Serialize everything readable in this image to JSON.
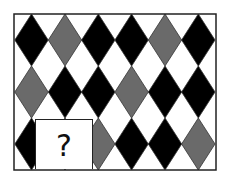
{
  "puzzle": {
    "frame": {
      "x": 14,
      "y": 14,
      "width": 202,
      "height": 156,
      "stroke": "#222222"
    },
    "diamond": {
      "half_width": 16.7,
      "half_height": 26,
      "outline": "#333333"
    },
    "columns_x": [
      31.5,
      65,
      98.3,
      131.6,
      165,
      198.3
    ],
    "rows_y": [
      40,
      92,
      144
    ],
    "colors": {
      "B": "#000000",
      "G": "#6a6a6a",
      "W": "#ffffff"
    },
    "grid": [
      [
        "B",
        "G",
        "B",
        "B",
        "G",
        "B"
      ],
      [
        "G",
        "B",
        "B",
        "G",
        "B",
        "B"
      ],
      [
        "B",
        "B",
        "G",
        "B",
        "B",
        "G"
      ]
    ],
    "missing_cell": {
      "row": 2,
      "col": 1
    },
    "question_mark": "?"
  }
}
